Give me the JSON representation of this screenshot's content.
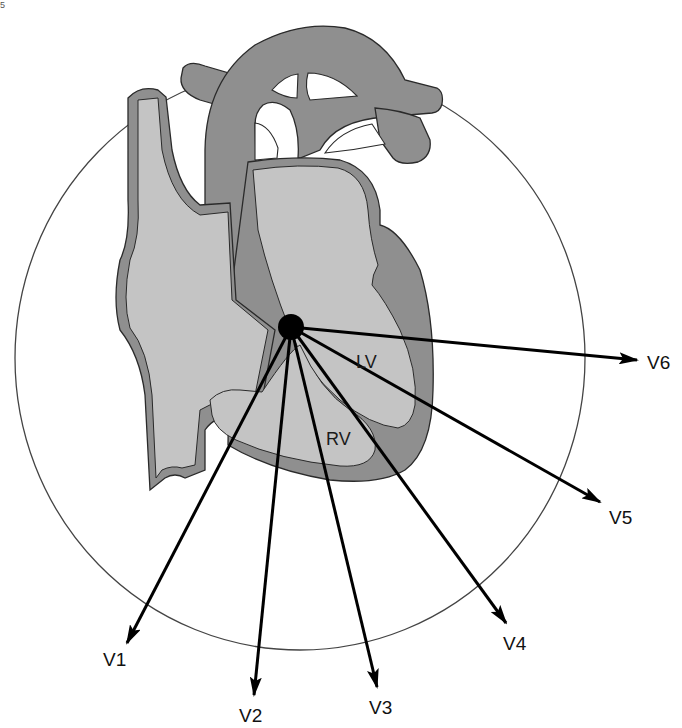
{
  "figure": {
    "colors": {
      "background": "#ffffff",
      "wall": "#8f8f8f",
      "chamber": "#c4c4c4",
      "outline": "#2a2a2a",
      "circle": "#444444",
      "arrow": "#000000"
    },
    "center": {
      "x": 291,
      "y": 327
    },
    "circle": {
      "cx": 300,
      "cy": 358,
      "rx": 285,
      "ry": 292
    }
  },
  "corner_mark": "5",
  "chambers": [
    {
      "id": "lv",
      "label": "LV",
      "x": 356,
      "y": 353
    },
    {
      "id": "rv",
      "label": "RV",
      "x": 326,
      "y": 430
    }
  ],
  "leads": [
    {
      "id": "v1",
      "label": "V1",
      "end": [
        127,
        643
      ],
      "label_pos": [
        103,
        650
      ]
    },
    {
      "id": "v2",
      "label": "V2",
      "end": [
        254,
        695
      ],
      "label_pos": [
        239,
        706
      ]
    },
    {
      "id": "v3",
      "label": "V3",
      "end": [
        377,
        687
      ],
      "label_pos": [
        369,
        698
      ]
    },
    {
      "id": "v4",
      "label": "V4",
      "end": [
        506,
        623
      ],
      "label_pos": [
        503,
        634
      ]
    },
    {
      "id": "v5",
      "label": "V5",
      "end": [
        600,
        502
      ],
      "label_pos": [
        609,
        508
      ]
    },
    {
      "id": "v6",
      "label": "V6",
      "end": [
        637,
        360
      ],
      "label_pos": [
        647,
        353
      ]
    }
  ]
}
